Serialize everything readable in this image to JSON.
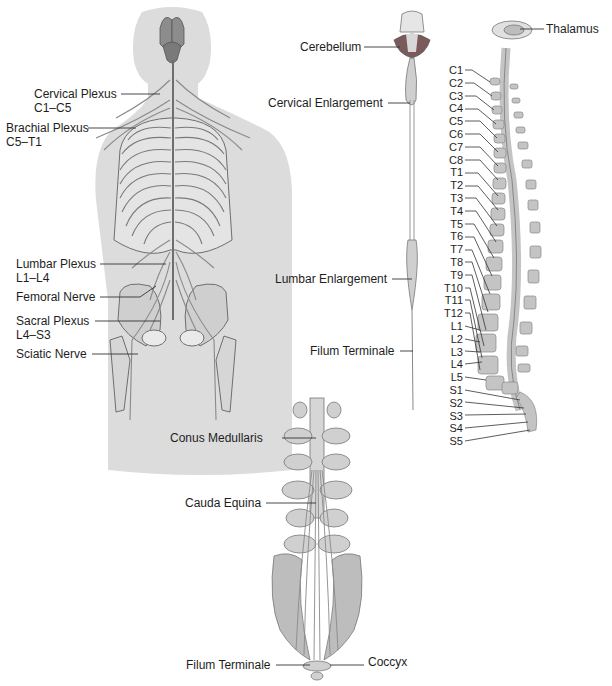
{
  "diagram": {
    "panels": {
      "posterior_body": {
        "labels": [
          {
            "id": "cervical_plexus",
            "name": "Cervical Plexus",
            "range": "C1–C5"
          },
          {
            "id": "brachial_plexus",
            "name": "Brachial Plexus",
            "range": "C5–T1"
          },
          {
            "id": "lumbar_plexus",
            "name": "Lumbar Plexus",
            "range": "L1–L4"
          },
          {
            "id": "femoral_nerve",
            "name": "Femoral Nerve",
            "range": ""
          },
          {
            "id": "sacral_plexus",
            "name": "Sacral Plexus",
            "range": "L4–S3"
          },
          {
            "id": "sciatic_nerve",
            "name": "Sciatic Nerve",
            "range": ""
          }
        ]
      },
      "isolated_cord": {
        "labels": [
          {
            "id": "cerebellum",
            "name": "Cerebellum"
          },
          {
            "id": "cervical_enlargement",
            "name": "Cervical Enlargement"
          },
          {
            "id": "lumbar_enlargement",
            "name": "Lumbar Enlargement"
          },
          {
            "id": "filum_terminale_mid",
            "name": "Filum Terminale"
          }
        ]
      },
      "lateral_column": {
        "thalamus": "Thalamus",
        "segments": [
          "C1",
          "C2",
          "C3",
          "C4",
          "C5",
          "C6",
          "C7",
          "C8",
          "T1",
          "T2",
          "T3",
          "T4",
          "T5",
          "T6",
          "T7",
          "T8",
          "T9",
          "T10",
          "T11",
          "T12",
          "L1",
          "L2",
          "L3",
          "L4",
          "L5",
          "S1",
          "S2",
          "S3",
          "S4",
          "S5"
        ]
      },
      "cauda_detail": {
        "labels": [
          {
            "id": "conus_medullaris",
            "name": "Conus Medullaris"
          },
          {
            "id": "cauda_equina",
            "name": "Cauda Equina"
          },
          {
            "id": "filum_terminale_bottom",
            "name": "Filum Terminale"
          },
          {
            "id": "coccyx",
            "name": "Coccyx"
          }
        ]
      }
    },
    "colors": {
      "body_silhouette": "#dcdcdc",
      "bone": "#c8c8c8",
      "bone_outline": "#6e6e6e",
      "nerve": "#8a8a8a",
      "brain": "#8c8c8c",
      "cerebellum": "#7a5a5a",
      "leader_line": "#333333"
    }
  }
}
